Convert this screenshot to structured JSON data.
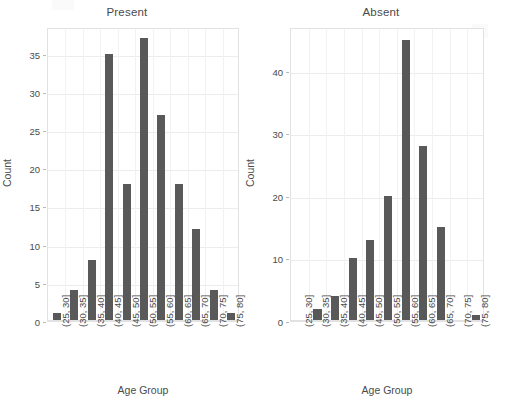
{
  "figure": {
    "xlabel": "Age Group",
    "ylabel": "Count",
    "bar_color": "#595959",
    "grid_color": "#ececec",
    "background": "#ffffff"
  },
  "panels": [
    {
      "title": "Present",
      "yticks": [
        "0",
        "5",
        "10",
        "15",
        "20",
        "25",
        "30",
        "35"
      ],
      "ylabel": "Count",
      "xlabel": "Age Group"
    },
    {
      "title": "Absent",
      "yticks": [
        "0",
        "10",
        "20",
        "30",
        "40"
      ],
      "ylabel": "Count",
      "xlabel": "Age Group"
    }
  ],
  "categories": [
    "(25, 30]",
    "(30, 35]",
    "(35, 40]",
    "(40, 45]",
    "(45, 50]",
    "(50, 55]",
    "(55, 60]",
    "(60, 65]",
    "(65, 70]",
    "(70, 75]",
    "(75, 80]"
  ],
  "chart_data": [
    {
      "type": "bar",
      "title": "Present",
      "xlabel": "Age Group",
      "ylabel": "Count",
      "categories": [
        "(25, 30]",
        "(30, 35]",
        "(35, 40]",
        "(40, 45]",
        "(45, 50]",
        "(50, 55]",
        "(55, 60]",
        "(60, 65]",
        "(65, 70]",
        "(70, 75]",
        "(75, 80]"
      ],
      "values": [
        1,
        4,
        8,
        35,
        18,
        37,
        27,
        18,
        12,
        4,
        1
      ],
      "ylim": [
        0,
        38.5
      ],
      "yticks": [
        0,
        5,
        10,
        15,
        20,
        25,
        30,
        35
      ],
      "grid": true,
      "legend": "none"
    },
    {
      "type": "bar",
      "title": "Absent",
      "xlabel": "Age Group",
      "ylabel": "Count",
      "categories": [
        "(25, 30]",
        "(30, 35]",
        "(35, 40]",
        "(40, 45]",
        "(45, 50]",
        "(50, 55]",
        "(55, 60]",
        "(60, 65]",
        "(65, 70]",
        "(70, 75]",
        "(75, 80]"
      ],
      "values": [
        0,
        2,
        4,
        10,
        13,
        20,
        45,
        28,
        15,
        0,
        1
      ],
      "ylim": [
        0,
        47
      ],
      "yticks": [
        0,
        10,
        20,
        30,
        40
      ],
      "grid": true,
      "legend": "none"
    }
  ]
}
